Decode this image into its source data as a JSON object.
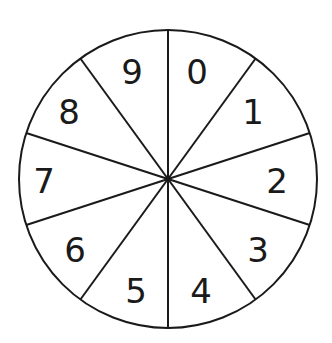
{
  "diagram": {
    "type": "spinner",
    "sections": 10,
    "center": [
      168,
      179
    ],
    "radius": 149,
    "stroke_color": "#1a1a1a",
    "background": "#ffffff",
    "labels": [
      {
        "text": "0",
        "x": 197,
        "y": 84
      },
      {
        "text": "1",
        "x": 253,
        "y": 124
      },
      {
        "text": "2",
        "x": 277,
        "y": 193
      },
      {
        "text": "3",
        "x": 258,
        "y": 262
      },
      {
        "text": "4",
        "x": 201,
        "y": 303
      },
      {
        "text": "5",
        "x": 136,
        "y": 303
      },
      {
        "text": "6",
        "x": 75,
        "y": 262
      },
      {
        "text": "7",
        "x": 44,
        "y": 193
      },
      {
        "text": "8",
        "x": 69,
        "y": 124
      },
      {
        "text": "9",
        "x": 132,
        "y": 84
      }
    ]
  }
}
